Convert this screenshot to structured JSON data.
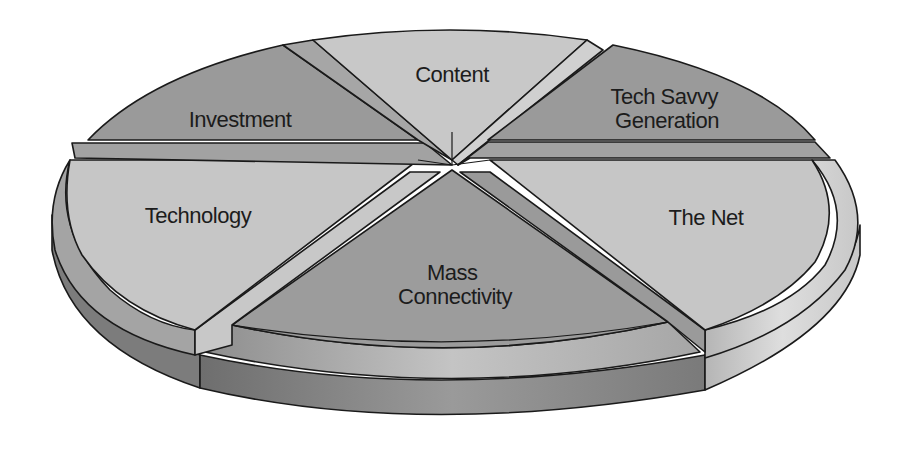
{
  "diagram": {
    "type": "exploded-3d-pie",
    "segments": [
      {
        "id": "content",
        "label_lines": [
          "Content"
        ],
        "shade": "light"
      },
      {
        "id": "tech-savvy-generation",
        "label_lines": [
          "Tech Savvy",
          "Generation"
        ],
        "shade": "dark"
      },
      {
        "id": "the-net",
        "label_lines": [
          "The Net"
        ],
        "shade": "light"
      },
      {
        "id": "mass-connectivity",
        "label_lines": [
          "Mass",
          "Connectivity"
        ],
        "shade": "dark"
      },
      {
        "id": "technology",
        "label_lines": [
          "Technology"
        ],
        "shade": "light"
      },
      {
        "id": "investment",
        "label_lines": [
          "Investment"
        ],
        "shade": "dark"
      }
    ],
    "colors": {
      "light_top": "#c4c4c4",
      "dark_top": "#9a9a9a",
      "light_side": "#d2d2d2",
      "dark_side": "#7e7e7e",
      "separator": "#a8a8a8",
      "outline": "#1a1a1a",
      "background": "#ffffff"
    }
  }
}
